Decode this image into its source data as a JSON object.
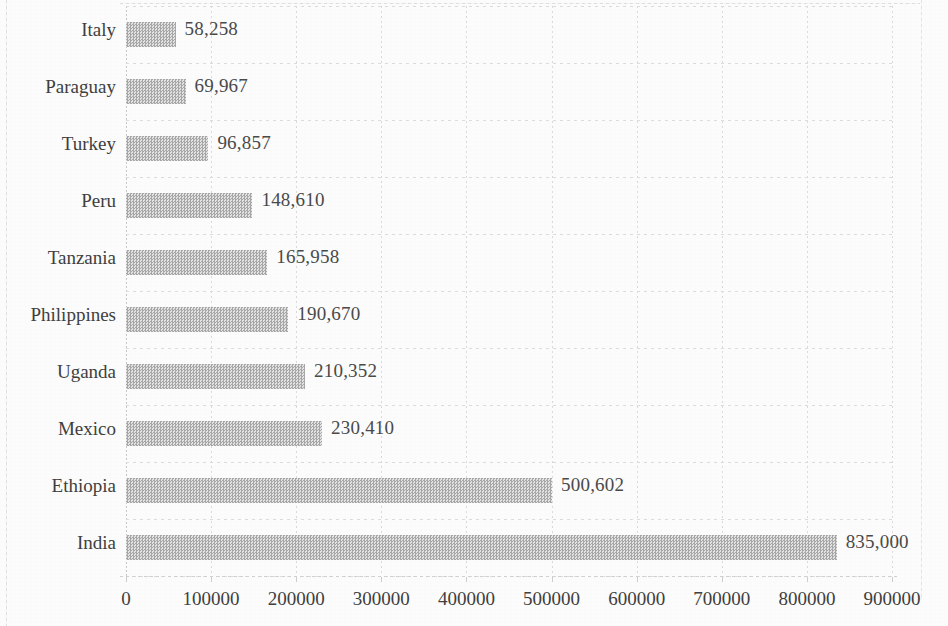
{
  "chart_data": {
    "type": "bar",
    "orientation": "horizontal",
    "title": "",
    "subtitle": "",
    "xlabel": "",
    "ylabel": "",
    "categories": [
      "India",
      "Ethiopia",
      "Mexico",
      "Uganda",
      "Philippines",
      "Tanzania",
      "Peru",
      "Turkey",
      "Paraguay",
      "Italy"
    ],
    "values": [
      835000,
      500602,
      230410,
      210352,
      190670,
      165958,
      148610,
      96857,
      69967,
      58258
    ],
    "value_labels": [
      "835,000",
      "500,602",
      "230,410",
      "210,352",
      "190,670",
      "165,958",
      "148,610",
      "96,857",
      "69,967",
      "58,258"
    ],
    "xlim": [
      0,
      900000
    ],
    "xticks": [
      0,
      100000,
      200000,
      300000,
      400000,
      500000,
      600000,
      700000,
      800000,
      900000
    ],
    "xtick_labels": [
      "0",
      "100000",
      "200000",
      "300000",
      "400000",
      "500000",
      "600000",
      "700000",
      "800000",
      "900000"
    ],
    "grid": true,
    "grid_axis": "x",
    "legend": false,
    "legend_position": "none",
    "data_labels": true,
    "data_label_position": "outside-end",
    "bar_fill": "#b9b9b9",
    "bar_pattern": "checkered-dither",
    "text_color": "#3f3f3f",
    "background": "#fdfdfd",
    "category_order_top_to_bottom": [
      "Italy",
      "Paraguay",
      "Turkey",
      "Peru",
      "Tanzania",
      "Philippines",
      "Uganda",
      "Mexico",
      "Ethiopia",
      "India"
    ]
  }
}
